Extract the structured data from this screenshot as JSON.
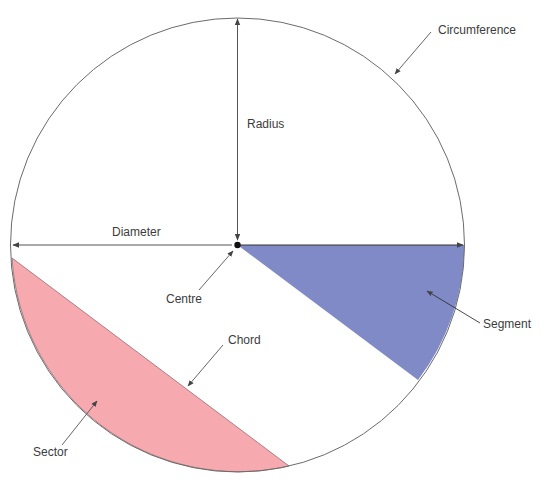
{
  "diagram": {
    "labels": {
      "circumference": "Circumference",
      "radius": "Radius",
      "diameter": "Diameter",
      "centre": "Centre",
      "segment": "Segment",
      "chord": "Chord",
      "sector": "Sector"
    },
    "colors": {
      "segment_fill": "#7f8ac6",
      "sector_fill": "#f6aab0",
      "outline": "#6b6b6b",
      "arrow": "#444444",
      "centre_dot": "#111111"
    },
    "caption": "Figure 10.1 Parts of a circle"
  }
}
